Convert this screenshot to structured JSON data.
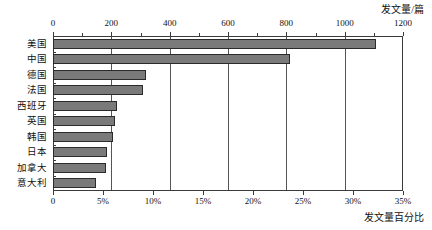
{
  "chart_data": {
    "type": "bar",
    "orientation": "horizontal",
    "title": "",
    "subtitle": "",
    "categories": [
      "美国",
      "中国",
      "德国",
      "法国",
      "西班牙",
      "英国",
      "韩国",
      "日本",
      "加拿大",
      "意大利"
    ],
    "values": [
      1108,
      813,
      319,
      310,
      220,
      213,
      204,
      186,
      181,
      147
    ],
    "series": [
      {
        "name": "发文量/篇",
        "values": [
          1108,
          813,
          319,
          310,
          220,
          213,
          204,
          186,
          181,
          147
        ]
      }
    ],
    "percent_values": [
      32.3,
      23.7,
      9.3,
      9.0,
      6.4,
      6.2,
      5.9,
      5.4,
      5.3,
      4.3
    ],
    "top_axis": {
      "label": "发文量/篇",
      "ticks": [
        0,
        200,
        400,
        600,
        800,
        1000,
        1200
      ],
      "tick_labels": [
        "0",
        "200",
        "400",
        "600",
        "800",
        "1000",
        "1200"
      ],
      "min": 0,
      "max": 1200,
      "minor_tick_step": 100
    },
    "bottom_axis": {
      "label": "发文量百分比",
      "ticks": [
        0,
        5,
        10,
        15,
        20,
        25,
        30,
        35
      ],
      "tick_labels": [
        "0",
        "5%",
        "10%",
        "15%",
        "20%",
        "25%",
        "30%",
        "35%"
      ],
      "min": 0,
      "max": 35
    },
    "ylabel": "",
    "grid": "vertical",
    "gridline_positions": [
      200,
      400,
      600,
      800,
      1000
    ],
    "legend": "none",
    "bar_color": "#7a7a7a",
    "bar_border_color": "#2b2b2b",
    "frame_color": "#3a3a3a",
    "background_color": "#ffffff"
  },
  "axes": {
    "top_title": "发文量/篇",
    "bottom_title": "发文量百分比"
  }
}
